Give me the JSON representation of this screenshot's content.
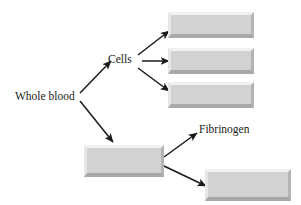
{
  "diagram": {
    "type": "flow-diagram",
    "labels": {
      "whole_blood": "Whole blood",
      "cells": "Cells",
      "fibrinogen": "Fibrinogen"
    },
    "boxes": [
      {
        "id": "cells-product-1",
        "text": ""
      },
      {
        "id": "cells-product-2",
        "text": ""
      },
      {
        "id": "cells-product-3",
        "text": ""
      },
      {
        "id": "plasma",
        "text": ""
      },
      {
        "id": "plasma-product",
        "text": ""
      }
    ],
    "arrows": [
      {
        "id": "whole-blood-to-cells",
        "from": "Whole blood",
        "to": "Cells"
      },
      {
        "id": "whole-blood-to-plasma",
        "from": "Whole blood",
        "to": "plasma"
      },
      {
        "id": "cells-to-product-1",
        "from": "Cells",
        "to": "cells-product-1"
      },
      {
        "id": "cells-to-product-2",
        "from": "Cells",
        "to": "cells-product-2"
      },
      {
        "id": "cells-to-product-3",
        "from": "Cells",
        "to": "cells-product-3"
      },
      {
        "id": "plasma-to-fibrinogen",
        "from": "plasma",
        "to": "Fibrinogen"
      },
      {
        "id": "plasma-to-product",
        "from": "plasma",
        "to": "plasma-product"
      }
    ],
    "colors": {
      "background": "#ffffff",
      "box_fill": "#d2d2d2",
      "box_highlight": "#f2f2f2",
      "box_shadow": "#a8a8a8",
      "arrow": "#1a1a1a",
      "text": "#1a1a1a"
    }
  }
}
